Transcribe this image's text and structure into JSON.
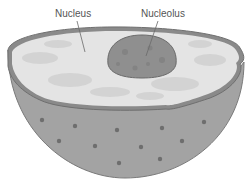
{
  "diagram": {
    "labels": [
      {
        "id": "nucleus",
        "text": "Nucleus"
      },
      {
        "id": "nucleolus",
        "text": "Nucleolus"
      }
    ],
    "colors": {
      "background": "#ffffff",
      "hemisphere_shell": "#a3a3a3",
      "shell_outline": "#6f6f6f",
      "envelope_rim": "#8a8a8a",
      "nucleoplasm": "#e4e4e4",
      "nucleoplasm_mottle": "#d2d2d2",
      "nucleolus": "#8f8f8f",
      "nucleolus_outline": "#6a6a6a",
      "pore": "#6e6e6e",
      "label_text": "#555555",
      "leader_line": "#6a6a6a"
    },
    "nuclear_pores": [
      {
        "x": 42,
        "y": 120
      },
      {
        "x": 75,
        "y": 126
      },
      {
        "x": 117,
        "y": 130
      },
      {
        "x": 162,
        "y": 128
      },
      {
        "x": 204,
        "y": 122
      },
      {
        "x": 59,
        "y": 141
      },
      {
        "x": 95,
        "y": 146
      },
      {
        "x": 141,
        "y": 147
      },
      {
        "x": 182,
        "y": 141
      },
      {
        "x": 119,
        "y": 163
      },
      {
        "x": 160,
        "y": 159
      }
    ]
  }
}
